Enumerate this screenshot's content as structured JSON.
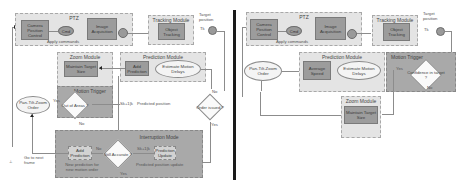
{
  "left": {
    "ptz": {
      "title": "PTZ",
      "camera_position_control": "Camera Position Control",
      "cmd_node": "Cmd",
      "image_acquisition": "Image Acquisition",
      "sum_node": "",
      "apply_commands": "Apply commands"
    },
    "tracking": {
      "title": "Tracking Module",
      "object_tracking": "Object Tracking",
      "target_position": "Target position",
      "tk_label": "Tk"
    },
    "zoom": {
      "title": "Zoom Module",
      "maintain_target_size": "Maintain Target Size"
    },
    "prediction": {
      "title": "Prediction Module",
      "add_prediction": "Add Prediction",
      "estimate_motion_delays": "Estimate Motion Delays"
    },
    "motion_trigger": {
      "title": "Motion Trigger",
      "out_of_areas": "Out of Areas ?",
      "yes": "Yes",
      "no": "No"
    },
    "pan_tilt_zoom_order": "Pan-Tilt-Zoom Order",
    "predicted_position_label": "Predicted position",
    "predicted_symbol": "Sk+1|k",
    "order_issued": "Order issued ?",
    "order_no": "No",
    "order_yes": "Yes",
    "interruption": {
      "title": "Interruption Mode",
      "still_accurate": "Still Accurate ?",
      "add_prediction": "Add Prediction",
      "prediction_update": "Prediction Update",
      "new_prediction": "New prediction for new motion order",
      "prediction_position_update": "Predicted position update",
      "no": "No",
      "yes": "Yes",
      "symbol": "Sk+1|k"
    },
    "go_to_next_frame": "Go to next frame"
  },
  "right": {
    "ptz": {
      "title": "PTZ",
      "camera_position_control": "Camera Position Control",
      "cmd_node": "Cmd",
      "image_acquisition": "Image Acquisition",
      "apply_commands": "Apply commands"
    },
    "tracking": {
      "title": "Tracking Module",
      "object_tracking": "Object Tracking",
      "target_position": "Target position",
      "tk_label": "Tk"
    },
    "prediction": {
      "title": "Prediction Module",
      "average_speed": "Average Speed",
      "estimate_motion_delays": "Estimate Motion Delays"
    },
    "motion_trigger": {
      "title": "Motion Trigger",
      "confidence": "Confidence in target ?",
      "yes": "Yes",
      "no": "No"
    },
    "zoom": {
      "title": "Zoom Module",
      "maintain_target_size": "Maintain Target Size"
    },
    "pan_tilt_zoom_order": "Pan-Tilt-Zoom Order"
  },
  "colors": {
    "module_light": "#e4e4e4",
    "module_dark": "#a9a9a9",
    "box": "#9c9c9c",
    "divider": "#1a1a1a"
  }
}
